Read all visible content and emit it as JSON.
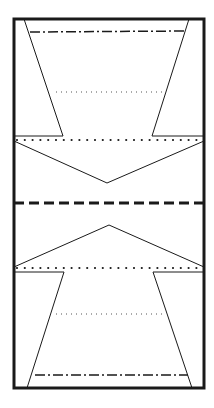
{
  "diagram": {
    "kind": "court-layout",
    "colors": {
      "background": "#ffffff",
      "ink": "#1a1a1a",
      "fine_ink": "#555555"
    },
    "elements": [
      {
        "name": "outer-boundary",
        "style": "solid-thick"
      },
      {
        "name": "top-trapezoid-zone",
        "style": "solid-thin"
      },
      {
        "name": "top-dash-dot-line",
        "style": "dash-dot"
      },
      {
        "name": "top-fine-dotted-line",
        "style": "fine-dotted"
      },
      {
        "name": "top-heavy-dotted-line",
        "style": "heavy-dotted"
      },
      {
        "name": "top-chevron",
        "style": "solid-thin"
      },
      {
        "name": "center-dashed-line",
        "style": "dashed-thick"
      },
      {
        "name": "bottom-chevron",
        "style": "solid-thin"
      },
      {
        "name": "bottom-heavy-dotted-line",
        "style": "heavy-dotted"
      },
      {
        "name": "bottom-trapezoid-zone",
        "style": "solid-thin"
      },
      {
        "name": "bottom-fine-dotted-line",
        "style": "fine-dotted"
      },
      {
        "name": "bottom-dash-dot-line",
        "style": "dash-dot"
      }
    ]
  }
}
